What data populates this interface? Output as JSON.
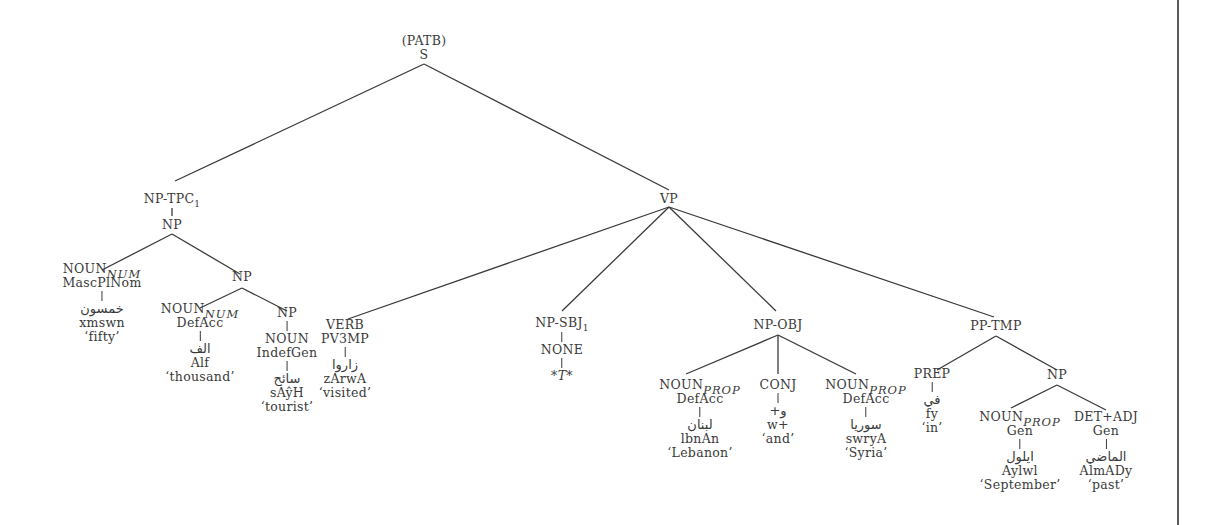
{
  "diagram": {
    "type": "syntax-tree",
    "root": {
      "annotation": "(PATB)",
      "label": "S"
    },
    "nodes": {
      "np_tpc": {
        "label": "NP-TPC",
        "index": "1"
      },
      "np_tpc_child": {
        "label": "NP"
      },
      "noun_fifty": {
        "label": "NOUN",
        "sub": "NUM",
        "features": "MascPlNom",
        "arabic": "خمسون",
        "translit": "xmswn",
        "gloss": "‘fifty’"
      },
      "np_inner": {
        "label": "NP"
      },
      "noun_thousand": {
        "label": "NOUN",
        "sub": "NUM",
        "features": "DefAcc",
        "arabic": "الف",
        "translit": "Alf",
        "gloss": "‘thousand’"
      },
      "np_tourist": {
        "label": "NP"
      },
      "noun_tourist": {
        "label": "NOUN",
        "features": "IndefGen",
        "arabic": "سائح",
        "translit": "sAŷH",
        "gloss": "‘tourist’"
      },
      "vp": {
        "label": "VP"
      },
      "verb": {
        "label": "VERB",
        "features": "PV3MP",
        "arabic": "زاروا",
        "translit": "zArwA",
        "gloss": "‘visited’"
      },
      "np_sbj": {
        "label": "NP-SBJ",
        "index": "1",
        "child": "NONE",
        "trace": "*T*"
      },
      "np_obj": {
        "label": "NP-OBJ"
      },
      "noun_lebanon": {
        "label": "NOUN",
        "sub": "PROP",
        "features": "DefAcc",
        "arabic": "لبنان",
        "translit": "lbnAn",
        "gloss": "‘Lebanon’"
      },
      "conj": {
        "label": "CONJ",
        "arabic": "و+",
        "translit": "w+",
        "gloss": "‘and’"
      },
      "noun_syria": {
        "label": "NOUN",
        "sub": "PROP",
        "features": "DefAcc",
        "arabic": "سوريا",
        "translit": "swryA",
        "gloss": "‘Syria’"
      },
      "pp_tmp": {
        "label": "PP-TMP"
      },
      "prep": {
        "label": "PREP",
        "arabic": "في",
        "translit": "fy",
        "gloss": "‘in’"
      },
      "np_pp": {
        "label": "NP"
      },
      "noun_september": {
        "label": "NOUN",
        "sub": "PROP",
        "features": "Gen",
        "arabic": "ايلول",
        "translit": "Aylwl",
        "gloss": "‘September’"
      },
      "det_adj": {
        "label": "DET+ADJ",
        "features": "Gen",
        "arabic": "الماضي",
        "translit": "AlmADy",
        "gloss": "‘past’"
      }
    },
    "colors": {
      "ink": "#3a3a3a",
      "background": "#ffffff",
      "rule": "#5a5a5a"
    }
  }
}
